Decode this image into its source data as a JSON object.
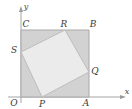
{
  "figure": {
    "background": "#ffffff"
  },
  "axes": {
    "x_label": "x",
    "y_label": "y",
    "x_axis_color": "#9a9a9a",
    "y_axis_color": "#9a9a9a",
    "origin_label": "O"
  },
  "colors": {
    "outer_square_fill": "#d2d2d2",
    "outer_square_stroke": "#a8a8a8",
    "inner_square_fill": "#ebebeb",
    "inner_square_stroke": "#bdbdbd",
    "label_color": "#3a3a3a",
    "axis_color": "#9a9a9a"
  },
  "outer_square": {
    "name": "OABC",
    "vertices": [
      {
        "label": "O",
        "x": 21,
        "y": 97,
        "label_x": 14,
        "label_y": 103
      },
      {
        "label": "A",
        "x": 89,
        "y": 97,
        "label_x": 86,
        "label_y": 103
      },
      {
        "label": "B",
        "x": 89,
        "y": 30,
        "label_x": 93,
        "label_y": 25
      },
      {
        "label": "C",
        "x": 21,
        "y": 30,
        "label_x": 25,
        "label_y": 25
      }
    ]
  },
  "inner_square": {
    "name": "PQRS",
    "vertices": [
      {
        "label": "P",
        "x": 42,
        "y": 97,
        "label_x": 42,
        "label_y": 104
      },
      {
        "label": "Q",
        "x": 89,
        "y": 72,
        "label_x": 94,
        "label_y": 71
      },
      {
        "label": "R",
        "x": 65,
        "y": 30,
        "label_x": 64,
        "label_y": 24
      },
      {
        "label": "S",
        "x": 21,
        "y": 52,
        "label_x": 15,
        "label_y": 50
      }
    ]
  },
  "labels": [
    {
      "id": "O",
      "text": "O"
    },
    {
      "id": "P",
      "text": "P"
    },
    {
      "id": "A",
      "text": "A"
    },
    {
      "id": "Q",
      "text": "Q"
    },
    {
      "id": "B",
      "text": "B"
    },
    {
      "id": "R",
      "text": "R"
    },
    {
      "id": "C",
      "text": "C"
    },
    {
      "id": "S",
      "text": "S"
    }
  ]
}
